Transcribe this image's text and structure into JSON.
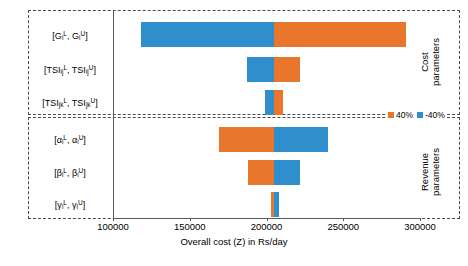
{
  "chart_data": {
    "type": "bar",
    "chart_subtype": "tornado",
    "title": "",
    "xlabel": "Overall cost (Z) in Rs/day",
    "ylabel": "",
    "xlim": [
      100000,
      300000
    ],
    "xticks": [
      "100000",
      "150000",
      "200000",
      "250000",
      "300000"
    ],
    "grid": false,
    "baseline": 205000,
    "legend_position": "right-middle",
    "legend": [
      {
        "name": "40%",
        "color": "#E8762C"
      },
      {
        "name": "-40%",
        "color": "#2E8FCC"
      }
    ],
    "groups": [
      {
        "name": "Cost parameters",
        "categories": [
          {
            "label_html": "[G<sub>i</sub><sup>L</sup>, G<sub>i</sub><sup>U</sup>]",
            "low": 118000,
            "high": 291000,
            "low_color": "#2E8FCC",
            "high_color": "#E8762C"
          },
          {
            "label_html": "[TSI<sub>ij</sub><sup>L</sup>, TSI<sub>ij</sub><sup>U</sup>]",
            "low": 187000,
            "high": 222000,
            "low_color": "#2E8FCC",
            "high_color": "#E8762C"
          },
          {
            "label_html": "[TSI<sub>jk</sub><sup>L</sup>, TSI<sub>jk</sub><sup>U</sup>]",
            "low": 199000,
            "high": 211000,
            "low_color": "#2E8FCC",
            "high_color": "#E8762C"
          }
        ]
      },
      {
        "name": "Revenue parameters",
        "categories": [
          {
            "label_html": "[&alpha;<sub>i</sub><sup>L</sup>, &alpha;<sub>i</sub><sup>U</sup>]",
            "low": 169000,
            "high": 240000,
            "low_color": "#E8762C",
            "high_color": "#2E8FCC"
          },
          {
            "label_html": "[&beta;<sub>i</sub><sup>L</sup>, &beta;<sub>i</sub><sup>U</sup>]",
            "low": 188000,
            "high": 222000,
            "low_color": "#E8762C",
            "high_color": "#2E8FCC"
          },
          {
            "label_html": "[&gamma;<sub>i</sub><sup>L</sup>, &gamma;<sub>i</sub><sup>U</sup>]",
            "low": 203000,
            "high": 208000,
            "low_color": "#E8762C",
            "high_color": "#2E8FCC"
          }
        ]
      }
    ]
  },
  "axis": {
    "title": "Overall cost (Z) in Rs/day",
    "ticks": [
      "100000",
      "150000",
      "200000",
      "250000",
      "300000"
    ]
  },
  "groups": {
    "cost": {
      "line1": "Cost",
      "line2": "parameters"
    },
    "revenue": {
      "line1": "Revenue",
      "line2": "parameters"
    }
  },
  "legend": {
    "positive_label": "40%",
    "negative_label": "-40%",
    "positive_color": "#E8762C",
    "negative_color": "#2E8FCC"
  }
}
